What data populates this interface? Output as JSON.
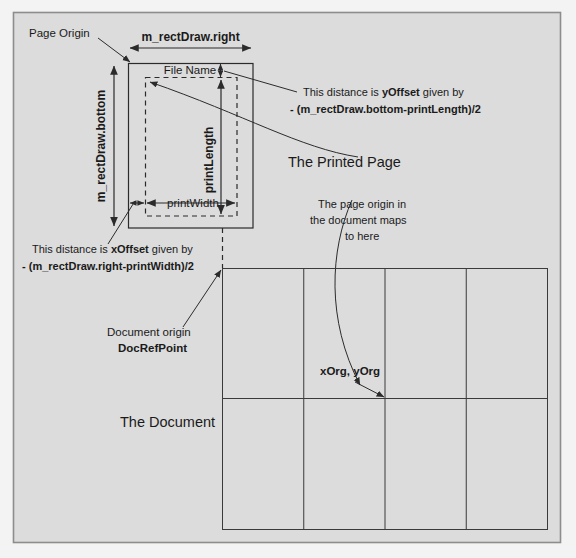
{
  "diagram": {
    "colors": {
      "page_background": "#f3f3f3",
      "panel_background": "#dcdcdc",
      "line": "#2b2b2b",
      "text": "#1a1a1a"
    },
    "labels": {
      "page_origin": "Page Origin",
      "rect_draw_right": "m_rectDraw.right",
      "rect_draw_bottom": "m_rectDraw.bottom",
      "file_name": "File Name",
      "print_length": "printLength",
      "print_width": "printWidth",
      "printed_page": "The Printed Page",
      "document": "The Document",
      "doc_origin_line1": "Document origin",
      "doc_origin_line2": "DocRefPoint",
      "x_org_y_org": "xOrg, yOrg"
    },
    "annotations": {
      "y_offset": {
        "line1_a": "This distance is ",
        "line1_b": "yOffset",
        "line1_c": " given by",
        "line2": "- (m_rectDraw.bottom-printLength)/2"
      },
      "x_offset": {
        "line1_a": "This distance is ",
        "line1_b": "xOffset",
        "line1_c": " given by",
        "line2": "- (m_rectDraw.right-printWidth)/2"
      },
      "page_origin_maps": {
        "line1": "The page origin in",
        "line2": "the document maps",
        "line3": "to here"
      }
    },
    "geometry": {
      "frame": {
        "x": 13,
        "y": 12,
        "width": 548,
        "height": 531
      },
      "page_rect": {
        "x": 128,
        "y": 63,
        "width": 125,
        "height": 165
      },
      "print_rect": {
        "x": 145,
        "y": 77,
        "width": 92,
        "height": 139
      },
      "document_rect": {
        "x": 222,
        "y": 268,
        "width": 326,
        "height": 262
      },
      "document_grid": {
        "columns": 4,
        "rows": 2
      }
    }
  }
}
